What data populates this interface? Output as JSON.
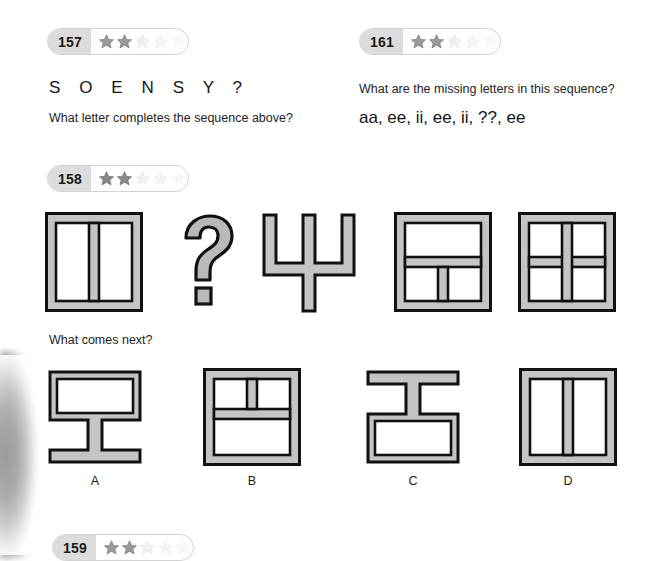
{
  "page": {
    "background": "#ffffff",
    "shape_outline_color": "#111111",
    "shape_fill_color": "#c2c2c2",
    "badge_number_bg": "#dcdcdc",
    "star_filled_color": "#8f8f8f",
    "star_empty_color": "#ededed"
  },
  "problems": [
    {
      "id": "157",
      "badge_label": "157",
      "stars_total": 5,
      "stars_filled": 2,
      "sequence_letters": "S    O    E    N    S    Y    ?",
      "question": "What letter completes the sequence above?"
    },
    {
      "id": "161",
      "badge_label": "161",
      "stars_total": 5,
      "stars_filled": 2,
      "question": "What are the missing letters in this sequence?",
      "sequence_text": "aa, ee, ii, ee, ii, ??, ee"
    },
    {
      "id": "158",
      "badge_label": "158",
      "stars_total": 5,
      "stars_filled": 2,
      "question": "What comes next?",
      "options": [
        {
          "label": "A",
          "name": "option-a"
        },
        {
          "label": "B",
          "name": "option-b"
        },
        {
          "label": "C",
          "name": "option-c"
        },
        {
          "label": "D",
          "name": "option-d"
        }
      ]
    },
    {
      "id": "159",
      "badge_label": "159",
      "stars_total": 5,
      "stars_filled": 2
    }
  ],
  "figures": {
    "prompt_row": [
      {
        "name": "figure-two-vertical-panes",
        "kind": "window"
      },
      {
        "name": "figure-question-mark",
        "kind": "question-mark"
      },
      {
        "name": "figure-trident",
        "kind": "trident"
      },
      {
        "name": "figure-top-pane-two-bottom",
        "kind": "window"
      },
      {
        "name": "figure-four-panes",
        "kind": "window"
      }
    ]
  }
}
